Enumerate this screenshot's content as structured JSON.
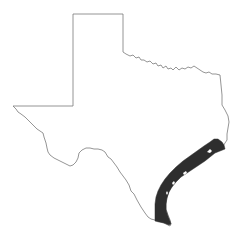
{
  "map": {
    "title": "Texas",
    "region_label": "Gulf Coast range",
    "colors": {
      "background": "#ffffff",
      "outline": "#7a7a7a",
      "highlight": "#2e2e2e"
    }
  }
}
